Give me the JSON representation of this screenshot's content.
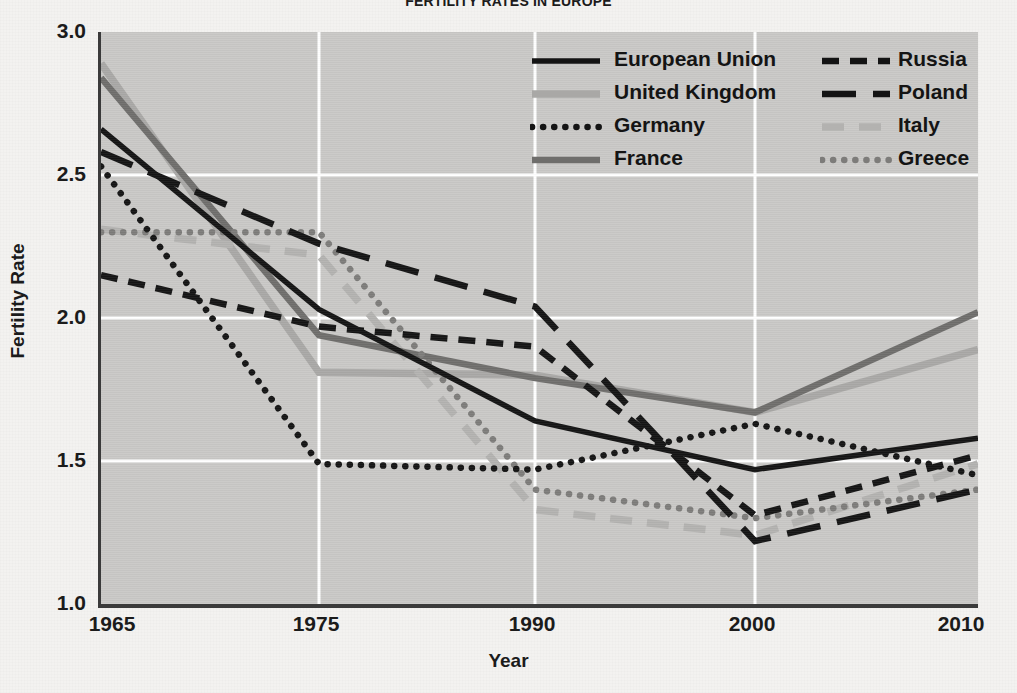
{
  "title": "FERTILITY RATES IN EUROPE",
  "axes": {
    "x_title": "Year",
    "y_title": "Fertility Rate",
    "y_ticks": [
      "3.0",
      "2.5",
      "2.0",
      "1.5",
      "1.0"
    ],
    "x_ticks": [
      "1965",
      "1975",
      "1990",
      "2000",
      "2010"
    ]
  },
  "legend": {
    "items": [
      {
        "label": "European Union",
        "style": "solid-black",
        "color": "#141414"
      },
      {
        "label": "Russia",
        "style": "dash-small-black",
        "color": "#141414"
      },
      {
        "label": "United Kingdom",
        "style": "solid-lightgray",
        "color": "#a9a8a6"
      },
      {
        "label": "Poland",
        "style": "dash-long-black",
        "color": "#141414"
      },
      {
        "label": "Germany",
        "style": "dotted-black",
        "color": "#141414"
      },
      {
        "label": "Italy",
        "style": "dash-lightgray",
        "color": "#b3b2b0"
      },
      {
        "label": "France",
        "style": "solid-midgray",
        "color": "#6f6e6c"
      },
      {
        "label": "Greece",
        "style": "dotted-midgray",
        "color": "#7d7c7a"
      }
    ]
  },
  "colors": {
    "plot_background": "#c9c8c6",
    "page_background": "#f3f2f0",
    "grid": "#ffffff",
    "axis": "#3a3a3a",
    "black": "#141414",
    "light_gray": "#a9a8a6",
    "mid_gray": "#6f6e6c"
  },
  "chart_data": {
    "type": "line",
    "title": "FERTILITY RATES IN EUROPE",
    "xlabel": "Year",
    "ylabel": "Fertility Rate",
    "x": [
      1965,
      1975,
      1990,
      2000,
      2010
    ],
    "xlim": [
      1965,
      2010
    ],
    "ylim": [
      1.0,
      3.0
    ],
    "grid": true,
    "legend_position": "top-right",
    "series": [
      {
        "name": "European Union",
        "values": [
          2.66,
          2.03,
          1.64,
          1.47,
          1.58
        ],
        "style": "solid-black",
        "color": "#141414"
      },
      {
        "name": "United Kingdom",
        "values": [
          2.89,
          1.81,
          1.8,
          1.67,
          1.89
        ],
        "style": "solid-lightgray",
        "color": "#a9a8a6"
      },
      {
        "name": "Germany",
        "values": [
          2.53,
          1.49,
          1.47,
          1.63,
          1.45
        ],
        "style": "dotted-black",
        "color": "#141414"
      },
      {
        "name": "France",
        "values": [
          2.84,
          1.94,
          1.79,
          1.67,
          2.02
        ],
        "style": "solid-midgray",
        "color": "#6f6e6c"
      },
      {
        "name": "Russia",
        "values": [
          2.15,
          1.97,
          1.9,
          1.31,
          1.52
        ],
        "style": "dash-small-black",
        "color": "#141414"
      },
      {
        "name": "Poland",
        "values": [
          2.58,
          2.26,
          2.04,
          1.22,
          1.4
        ],
        "style": "dash-long-black",
        "color": "#141414"
      },
      {
        "name": "Italy",
        "values": [
          2.31,
          2.22,
          1.33,
          1.24,
          1.49
        ],
        "style": "dash-lightgray",
        "color": "#b3b2b0"
      },
      {
        "name": "Greece",
        "values": [
          2.3,
          2.3,
          1.4,
          1.3,
          1.4
        ],
        "style": "dotted-midgray",
        "color": "#7d7c7a"
      }
    ]
  }
}
